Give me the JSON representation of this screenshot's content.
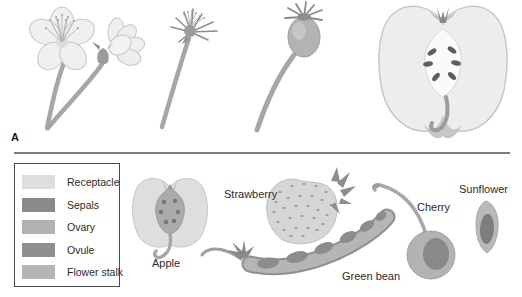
{
  "panel_label": "A",
  "legend": {
    "items": [
      {
        "label": "Receptacle",
        "color": "#dedede"
      },
      {
        "label": "Sepals",
        "color": "#8a8a8a"
      },
      {
        "label": "Ovary",
        "color": "#b2b2b2"
      },
      {
        "label": "Ovule",
        "color": "#8f8f8f"
      },
      {
        "label": "Flower stalk",
        "color": "#b5b5b5"
      }
    ]
  },
  "fruit_labels": {
    "apple": "Apple",
    "strawberry": "Strawberry",
    "green_bean": "Green bean",
    "cherry": "Cherry",
    "sunflower": "Sunflower"
  }
}
